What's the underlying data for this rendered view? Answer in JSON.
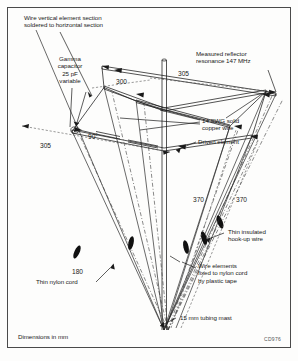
{
  "figure": {
    "caption_bottom_left": "Dimensions in mm",
    "corner_code": "CD976",
    "border_color": "#4a4a4a",
    "line_color": "#1a1a1a",
    "tape_color": "#111111"
  },
  "annotations": {
    "vertical_element_note": "Wire vertical element section\nsoldered to horizontal section",
    "gamma_capacitor": "Gamma\ncapacitor\n25 pF\nvariable",
    "measured_resonance": "Measured reflector\nresonance 147 MHz",
    "copper_wire": "14 SWG solid\ncopper wire",
    "driven_element": "Driven element",
    "hookup_wire": "Thin insulated\nhook-up wire",
    "plastic_tape": "Wire elements\nfixed to nylon cord\nby plastic tape",
    "tubing_mast": "15 mm tubing mast",
    "nylon_cord": "Thin nylon cord"
  },
  "dimensions": {
    "d300": "300",
    "d305_top": "305",
    "d305_left": "305",
    "angle_90": "90°",
    "d370_left": "370",
    "d370_right": "370",
    "d180": "180"
  }
}
